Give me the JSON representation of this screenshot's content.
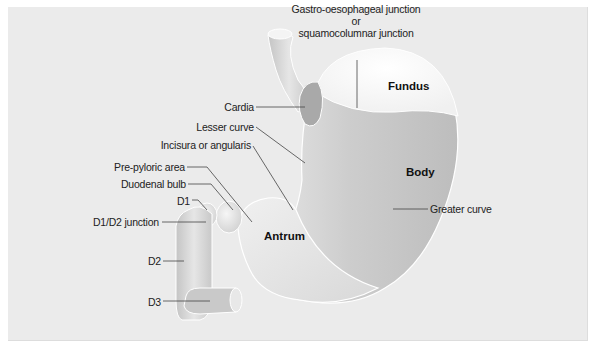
{
  "figure": {
    "colors": {
      "background": "#ebebeb",
      "organ_light": "#f2f2f2",
      "organ_mid": "#cfcfcf",
      "organ_dark": "#b5b5b5",
      "leader_line": "#444444",
      "text": "#222222"
    },
    "region_labels": [
      {
        "id": "fundus",
        "text": "Fundus",
        "x": 388,
        "y": 86
      },
      {
        "id": "body",
        "text": "Body",
        "x": 406,
        "y": 172
      },
      {
        "id": "antrum",
        "text": "Antrum",
        "x": 264,
        "y": 236
      }
    ],
    "callouts": [
      {
        "id": "gastro-oesophageal-junction",
        "lines": [
          "Gastro-oesophageal junction",
          "or",
          "squamocolumnar junction"
        ],
        "align": "center",
        "x": 356,
        "y": 2,
        "w": 150,
        "leader": [
          [
            357,
            60
          ],
          [
            357,
            108
          ]
        ]
      },
      {
        "id": "cardia",
        "text": "Cardia",
        "align": "right",
        "x": 222,
        "y": 100,
        "leader": [
          [
            256,
            107
          ],
          [
            305,
            107
          ]
        ]
      },
      {
        "id": "lesser-curve",
        "text": "Lesser curve",
        "align": "right",
        "x": 190,
        "y": 120,
        "leader": [
          [
            256,
            127
          ],
          [
            305,
            163
          ]
        ]
      },
      {
        "id": "incisura-or-angularis",
        "text": "Incisura or angularis",
        "align": "right",
        "x": 150,
        "y": 137,
        "leader": [
          [
            253,
            146
          ],
          [
            293,
            210
          ]
        ]
      },
      {
        "id": "pre-pyloric-area",
        "text": "Pre-pyloric area",
        "align": "right",
        "x": 122,
        "y": 160,
        "leader": [
          [
            187,
            167
          ],
          [
            207,
            167
          ],
          [
            252,
            222
          ]
        ]
      },
      {
        "id": "duodenal-bulb",
        "text": "Duodenal bulb",
        "align": "right",
        "x": 131,
        "y": 177,
        "leader": [
          [
            188,
            184
          ],
          [
            211,
            184
          ],
          [
            233,
            210
          ]
        ]
      },
      {
        "id": "d1",
        "text": "D1",
        "align": "right",
        "x": 176,
        "y": 196,
        "leader": [
          [
            192,
            200
          ],
          [
            198,
            200
          ],
          [
            207,
            210
          ]
        ]
      },
      {
        "id": "d1-d2-junction",
        "text": "D1/D2 junction",
        "align": "right",
        "x": 104,
        "y": 215,
        "leader": [
          [
            162,
            222
          ],
          [
            206,
            222
          ]
        ]
      },
      {
        "id": "d2",
        "text": "D2",
        "align": "right",
        "x": 149,
        "y": 253,
        "leader": [
          [
            163,
            261
          ],
          [
            184,
            261
          ]
        ]
      },
      {
        "id": "d3",
        "text": "D3",
        "align": "right",
        "x": 149,
        "y": 294,
        "leader": [
          [
            163,
            301
          ],
          [
            210,
            301
          ]
        ]
      },
      {
        "id": "greater-curve",
        "text": "Greater curve",
        "align": "left",
        "x": 430,
        "y": 202,
        "leader": [
          [
            393,
            209
          ],
          [
            428,
            209
          ]
        ]
      }
    ]
  }
}
